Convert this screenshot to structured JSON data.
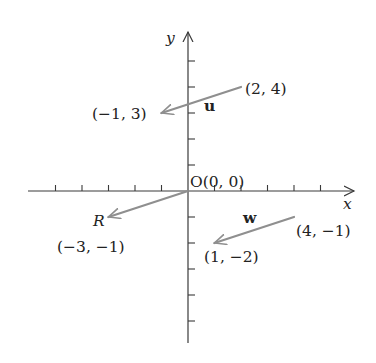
{
  "figure": {
    "background": "#ffffff",
    "axis_color": "#3a3a3a",
    "vector_color": "#8f8f8f",
    "origin_px": [
      188,
      191
    ],
    "unit_px": [
      26.5,
      26
    ],
    "x_axis": {
      "label": "x",
      "from_px": 28,
      "to_px": 354,
      "ticks": [
        -5,
        -4,
        -3,
        -2,
        -1,
        1,
        2,
        3,
        4,
        5
      ]
    },
    "y_axis": {
      "label": "y",
      "from_px": 343,
      "to_px": 32,
      "ticks": [
        -5,
        -4,
        -3,
        -2,
        -1,
        1,
        2,
        3,
        4,
        5
      ]
    },
    "origin_label": "O(0, 0)",
    "vectors": [
      {
        "name": "u",
        "label": "u",
        "tail": [
          2,
          4
        ],
        "head": [
          -1,
          3
        ],
        "tail_label": "(2, 4)",
        "head_label": "(−1, 3)"
      },
      {
        "name": "R",
        "label": "R",
        "tail": [
          0,
          0
        ],
        "head": [
          -3,
          -1
        ],
        "tail_label": "",
        "head_label": "(−3, −1)"
      },
      {
        "name": "w",
        "label": "w",
        "tail": [
          4,
          -1
        ],
        "head": [
          1,
          -2
        ],
        "tail_label": "(4, −1)",
        "head_label": "(1, −2)"
      }
    ]
  },
  "labels": {
    "y_axis": "y",
    "x_axis": "x",
    "origin": "O(0, 0)",
    "u_name": "u",
    "u_tail": "(2, 4)",
    "u_head": "(−1, 3)",
    "r_name": "R",
    "r_head": "(−3, −1)",
    "w_name": "w",
    "w_tail": "(4, −1)",
    "w_head": "(1, −2)"
  }
}
